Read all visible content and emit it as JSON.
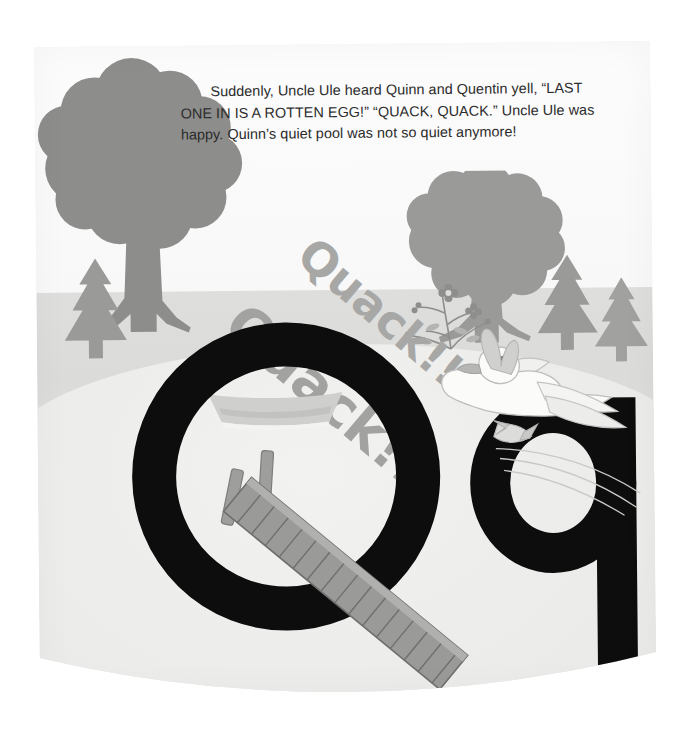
{
  "page": {
    "type": "childrens-alphabet-book-page",
    "letter_upper": "Q",
    "letter_lower": "q",
    "background_color": "#ffffff",
    "paper_color": "#f6f6f5"
  },
  "story": {
    "paragraph": "Suddenly, Uncle Ule heard Quinn and Quentin yell, “LAST ONE IN IS A ROTTEN EGG!” “QUACK, QUACK.” Uncle Ule was happy. Quinn’s quiet pool was not so quiet anymore!",
    "text_color": "#2b2b2b"
  },
  "sound_effects": [
    {
      "id": "quack-upper",
      "text": "Quack!!",
      "rotation_deg": 41,
      "color": "#a7a7a6"
    },
    {
      "id": "quack-lower",
      "text": "Quack!!",
      "rotation_deg": 41,
      "color": "#a2a2a1"
    }
  ],
  "illustration": {
    "letters": {
      "uppercase": {
        "glyph": "Q",
        "color": "#0d0d0d"
      },
      "lowercase": {
        "glyph": "q",
        "color": "#0d0d0d"
      }
    },
    "scene_colors": {
      "sky": "#fafafa",
      "ground": "#dededd",
      "water": "#efefee",
      "foliage": "#8d8d8c",
      "pine": "#9a9a99",
      "dock": "#9a9a99",
      "dock_plank_line": "#6f6f6e",
      "boat": "#c9c9c8",
      "duck": "#fbfbfa",
      "duck_outline": "#bdbdbc",
      "duck_beak": "#b6b6b5"
    },
    "objects": [
      {
        "name": "deciduous-tree-left",
        "label": "Tree"
      },
      {
        "name": "deciduous-tree-right",
        "label": "Tree"
      },
      {
        "name": "pine-tree-left",
        "label": "Pine tree"
      },
      {
        "name": "pine-tree-right-1",
        "label": "Pine tree"
      },
      {
        "name": "pine-tree-right-2",
        "label": "Pine tree"
      },
      {
        "name": "pond-water",
        "label": "Quiet pool"
      },
      {
        "name": "rowboat",
        "label": "Boat"
      },
      {
        "name": "wooden-dock",
        "label": "Dock"
      },
      {
        "name": "flying-duck",
        "label": "Duck"
      },
      {
        "name": "wildflowers",
        "label": "Flowers"
      }
    ]
  }
}
